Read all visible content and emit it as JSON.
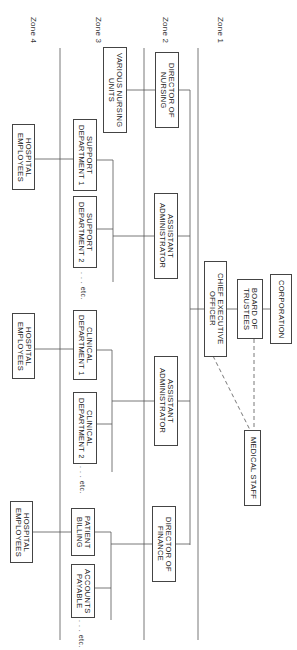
{
  "zones": [
    {
      "label": "Zone 1"
    },
    {
      "label": "Zone 2"
    },
    {
      "label": "Zone 3"
    },
    {
      "label": "Zone 4"
    }
  ],
  "zone1": {
    "corporation": "CORPORATION",
    "board": "BOARD OF\nTRUSTEES",
    "ceo": "CHIEF EXECUTIVE\nOFFICER",
    "medical_staff": "MEDICAL STAFF"
  },
  "zone2": {
    "director_nursing": "DIRECTOR OF\nNURSING",
    "assistant_admin_1": "ASSISTANT\nADMINISTRATOR",
    "assistant_admin_2": "ASSISTANT\nADMINISTRATOR",
    "director_finance": "DIRECTOR OF\nFINANCE"
  },
  "zone3": {
    "nursing_units": "VARIOUS NURSING\nUNITS",
    "support_dept_1": "SUPPORT\nDEPARTMENT 1",
    "support_dept_2": "SUPPORT\nDEPARTMENT 2",
    "clinical_dept_1": "CLINICAL\nDEPARTMENT 1",
    "clinical_dept_2": "CLINICAL\nDEPARTMENT 2",
    "patient_billing": "PATIENT\nBILLING",
    "accounts_payable": "ACCOUNTS\nPAYABLE",
    "etc": ". . . etc."
  },
  "zone4": {
    "employees_1": "HOSPITAL\nEMPLOYEES",
    "employees_2": "HOSPITAL\nEMPLOYEES",
    "employees_3": "HOSPITAL\nEMPLOYEES"
  },
  "colors": {
    "line": "#555555",
    "box_border": "#444444",
    "background": "#ffffff"
  }
}
